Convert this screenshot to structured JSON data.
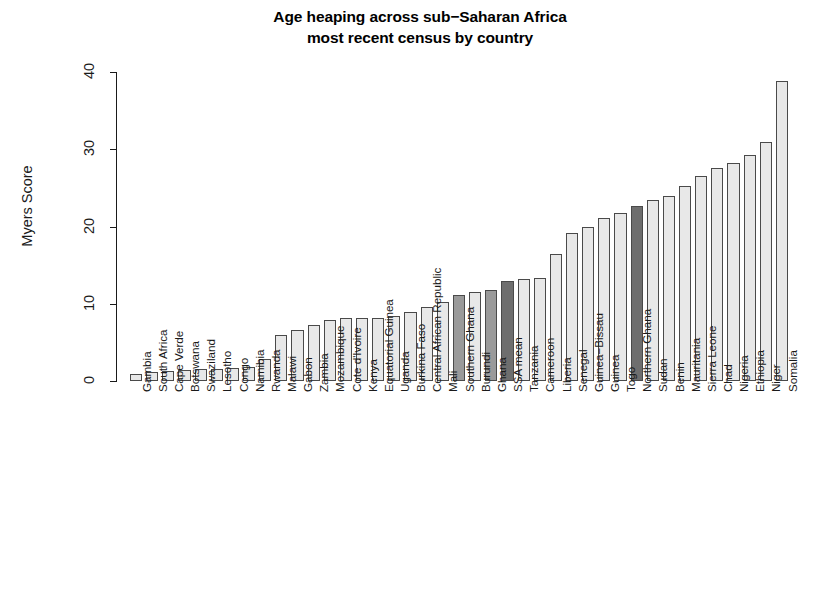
{
  "chart_data": {
    "type": "bar",
    "title_lines": [
      "Age heaping across sub−Saharan Africa",
      "most recent census by country"
    ],
    "xlabel": "",
    "ylabel": "Myers Score",
    "ylim": [
      0,
      40
    ],
    "yticks": [
      0,
      10,
      20,
      30,
      40
    ],
    "ytick_labels": [
      "0",
      "10",
      "20",
      "30",
      "40"
    ],
    "grid": false,
    "legend": "none",
    "orientation": "vertical",
    "categories": [
      "Gambia",
      "South Africa",
      "Cape Verde",
      "Botswana",
      "Swaziland",
      "Lesotho",
      "Congo",
      "Namibia",
      "Rwanda",
      "Malawi",
      "Gabon",
      "Zambia",
      "Mozambique",
      "Cote d'Ivoire",
      "Kenya",
      "Equatorial Guinea",
      "Uganda",
      "Burkina Faso",
      "Central African Republic",
      "Mali",
      "Southern Ghana",
      "Burundi",
      "Ghana",
      "SSA mean",
      "Tanzania",
      "Cameroon",
      "Liberia",
      "Senegal",
      "Guinea−Bissau",
      "Guinea",
      "Togo",
      "Northern Ghana",
      "Sudan",
      "Benin",
      "Mauritania",
      "Sierra Leone",
      "Chad",
      "Nigeria",
      "Ethiopia",
      "Niger",
      "Somalia"
    ],
    "values": [
      0.9,
      1.2,
      1.3,
      1.4,
      1.5,
      1.6,
      1.7,
      1.8,
      2.8,
      6.0,
      6.6,
      7.3,
      7.9,
      8.1,
      8.2,
      8.2,
      8.4,
      8.9,
      9.6,
      10.2,
      11.1,
      11.5,
      11.8,
      13.0,
      13.2,
      13.4,
      16.5,
      19.1,
      20.0,
      21.1,
      21.8,
      22.6,
      23.4,
      23.9,
      25.3,
      26.5,
      27.6,
      28.2,
      29.2,
      31.0,
      38.9
    ],
    "bar_styles": [
      "light",
      "light",
      "light",
      "light",
      "light",
      "light",
      "light",
      "light",
      "light",
      "light",
      "light",
      "light",
      "light",
      "light",
      "light",
      "light",
      "light",
      "light",
      "light",
      "light",
      "mid",
      "light",
      "mid",
      "dark",
      "light",
      "light",
      "light",
      "light",
      "light",
      "light",
      "light",
      "dark",
      "light",
      "light",
      "light",
      "light",
      "light",
      "light",
      "light",
      "light",
      "light"
    ],
    "colors": {
      "bar_light": "#e8e8e8",
      "bar_mid": "#9a9a9a",
      "bar_dark": "#6e6e6e",
      "bar_border": "#4a4a4a",
      "axis": "#1a1a1a",
      "text": "#000000",
      "background": "#ffffff"
    },
    "highlighted_categories": [
      "Southern Ghana",
      "Ghana",
      "SSA mean",
      "Northern Ghana"
    ]
  }
}
